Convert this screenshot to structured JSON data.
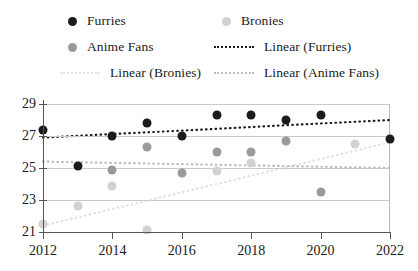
{
  "legend": {
    "entries": [
      {
        "label": "Furries",
        "kind": "marker",
        "color": "#1c1c1c",
        "name": "legend-furries"
      },
      {
        "label": "Bronies",
        "kind": "marker",
        "color": "#d2d2d2",
        "name": "legend-bronies"
      },
      {
        "label": "Anime Fans",
        "kind": "marker",
        "color": "#9a9a9a",
        "name": "legend-anime-fans"
      },
      {
        "label": "Linear (Furries)",
        "kind": "line",
        "color": "#1c1c1c",
        "name": "legend-linear-furries"
      },
      {
        "label": "Linear (Bronies)",
        "kind": "line",
        "color": "#e0e0e0",
        "name": "legend-linear-bronies"
      },
      {
        "label": "Linear (Anime Fans)",
        "kind": "line",
        "color": "#bdbdbd",
        "name": "legend-linear-anime-fans"
      }
    ]
  },
  "chart_data": {
    "type": "scatter",
    "title": "",
    "xlabel": "",
    "ylabel": "",
    "xlim": [
      2012,
      2022
    ],
    "ylim": [
      21,
      29
    ],
    "xticks": [
      2012,
      2014,
      2016,
      2018,
      2020,
      2022
    ],
    "yticks": [
      21,
      23,
      25,
      27,
      29
    ],
    "grid": true,
    "legend_position": "top",
    "series": [
      {
        "name": "Furries",
        "color": "#1c1c1c",
        "x": [
          2012,
          2013,
          2014,
          2015,
          2016,
          2017,
          2018,
          2019,
          2020,
          2022
        ],
        "values": [
          27.4,
          25.1,
          27.0,
          27.8,
          27.0,
          28.3,
          28.3,
          28.0,
          28.3,
          26.8
        ]
      },
      {
        "name": "Anime Fans",
        "color": "#9a9a9a",
        "x": [
          2014,
          2015,
          2016,
          2017,
          2018,
          2019,
          2020
        ],
        "values": [
          24.9,
          26.3,
          24.7,
          26.0,
          26.0,
          26.7,
          23.5
        ]
      },
      {
        "name": "Bronies",
        "color": "#d2d2d2",
        "x": [
          2012,
          2013,
          2014,
          2015,
          2017,
          2018,
          2021
        ],
        "values": [
          21.5,
          22.6,
          23.9,
          21.1,
          24.8,
          25.3,
          26.5
        ]
      }
    ],
    "trendlines": [
      {
        "name": "Linear (Furries)",
        "color": "#1c1c1c",
        "x": [
          2012,
          2022
        ],
        "values": [
          26.9,
          28.0
        ]
      },
      {
        "name": "Linear (Anime Fans)",
        "color": "#bdbdbd",
        "x": [
          2012,
          2022
        ],
        "values": [
          25.4,
          25.0
        ]
      },
      {
        "name": "Linear (Bronies)",
        "color": "#e0e0e0",
        "x": [
          2012,
          2022
        ],
        "values": [
          21.4,
          26.6
        ]
      }
    ]
  }
}
